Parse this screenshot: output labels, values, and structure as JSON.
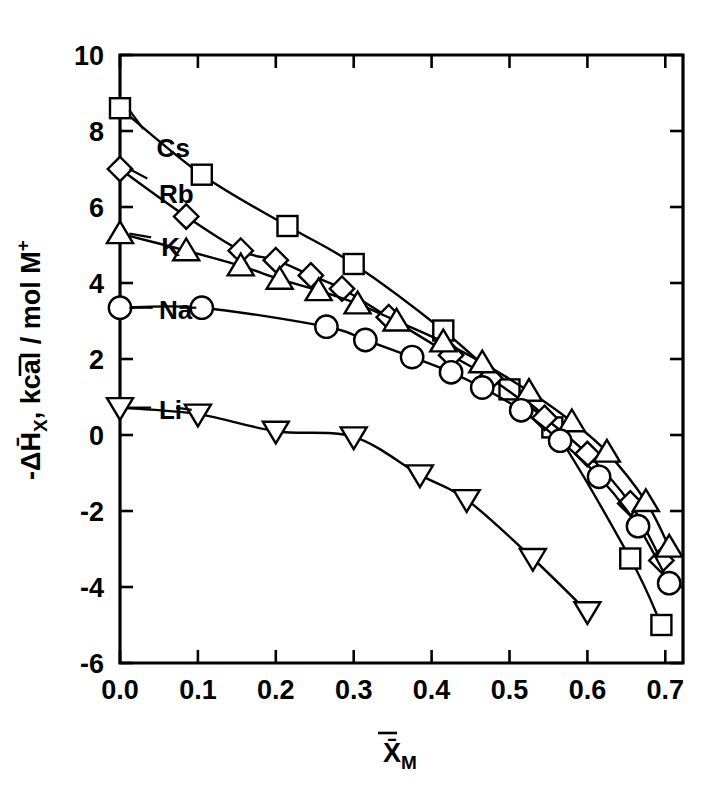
{
  "chart_data": {
    "type": "line",
    "title": "",
    "xlabel": "X̄M",
    "xlabel_main": "X̄",
    "xlabel_sub": "M",
    "ylabel": "-ΔH̄X, kcal / mol M+",
    "ylabel_parts": {
      "minus": "-ΔH̄",
      "sub": "X",
      "rest": ", kcal / mol M",
      "sup": "+"
    },
    "xlim": [
      0.0,
      0.72
    ],
    "ylim": [
      -6,
      10
    ],
    "xticks": [
      0.0,
      0.1,
      0.2,
      0.3,
      0.4,
      0.5,
      0.6,
      0.7
    ],
    "xtick_labels": [
      "0.0",
      "0.1",
      "0.2",
      "0.3",
      "0.4",
      "0.5",
      "0.6",
      "0.7"
    ],
    "yticks": [
      -6,
      -4,
      -2,
      0,
      2,
      4,
      6,
      8,
      10
    ],
    "ytick_labels": [
      "-6",
      "-4",
      "-2",
      "0",
      "2",
      "4",
      "6",
      "8",
      "10"
    ],
    "grid": false,
    "legend": "inline-labels-left",
    "series": [
      {
        "name": "Cs",
        "label": "Cs",
        "marker": "square",
        "label_x": 0.047,
        "label_y": 7.55,
        "leader": [
          [
            0.03,
            8.05
          ],
          [
            0.012,
            8.55
          ]
        ],
        "x": [
          0.0,
          0.105,
          0.215,
          0.3,
          0.415,
          0.5,
          0.555,
          0.655,
          0.695
        ],
        "y": [
          8.6,
          6.85,
          5.5,
          4.5,
          2.75,
          1.2,
          0.2,
          -3.25,
          -5.0
        ]
      },
      {
        "name": "Rb",
        "label": "Rb",
        "marker": "diamond",
        "label_x": 0.05,
        "label_y": 6.35,
        "leader": [
          [
            0.035,
            6.75
          ],
          [
            0.012,
            7.0
          ]
        ],
        "x": [
          0.0,
          0.085,
          0.155,
          0.2,
          0.245,
          0.285,
          0.345,
          0.425,
          0.475,
          0.545,
          0.6,
          0.655,
          0.695
        ],
        "y": [
          7.0,
          5.75,
          4.85,
          4.6,
          4.2,
          3.85,
          3.1,
          2.1,
          1.5,
          0.45,
          -0.5,
          -1.8,
          -3.3
        ]
      },
      {
        "name": "K",
        "label": "K",
        "marker": "triangle-up",
        "label_x": 0.053,
        "label_y": 4.95,
        "leader": [
          [
            0.04,
            5.2
          ],
          [
            0.012,
            5.3
          ]
        ],
        "x": [
          0.0,
          0.085,
          0.155,
          0.205,
          0.255,
          0.305,
          0.355,
          0.415,
          0.465,
          0.525,
          0.58,
          0.625,
          0.675,
          0.705
        ],
        "y": [
          5.3,
          4.85,
          4.45,
          4.1,
          3.8,
          3.45,
          3.0,
          2.45,
          1.9,
          1.15,
          0.35,
          -0.45,
          -1.75,
          -2.95
        ]
      },
      {
        "name": "Na",
        "label": "Na",
        "marker": "circle",
        "label_x": 0.05,
        "label_y": 3.3,
        "leader": [
          [
            0.042,
            3.35
          ],
          [
            0.012,
            3.35
          ]
        ],
        "leader2": [
          [
            0.077,
            3.35
          ],
          [
            0.098,
            3.35
          ]
        ],
        "x": [
          0.0,
          0.105,
          0.265,
          0.315,
          0.375,
          0.425,
          0.465,
          0.515,
          0.565,
          0.615,
          0.665,
          0.705
        ],
        "y": [
          3.35,
          3.35,
          2.85,
          2.5,
          2.05,
          1.65,
          1.25,
          0.65,
          -0.15,
          -1.1,
          -2.4,
          -3.9
        ]
      },
      {
        "name": "Li",
        "label": "Li",
        "marker": "triangle-down",
        "label_x": 0.05,
        "label_y": 0.65,
        "leader": [
          [
            0.04,
            0.72
          ],
          [
            0.012,
            0.72
          ]
        ],
        "leader2": [
          [
            0.072,
            0.72
          ],
          [
            0.092,
            0.66
          ]
        ],
        "x": [
          0.0,
          0.1,
          0.2,
          0.3,
          0.385,
          0.445,
          0.53,
          0.6
        ],
        "y": [
          0.72,
          0.55,
          0.1,
          -0.05,
          -1.05,
          -1.7,
          -3.25,
          -4.65
        ]
      }
    ]
  }
}
